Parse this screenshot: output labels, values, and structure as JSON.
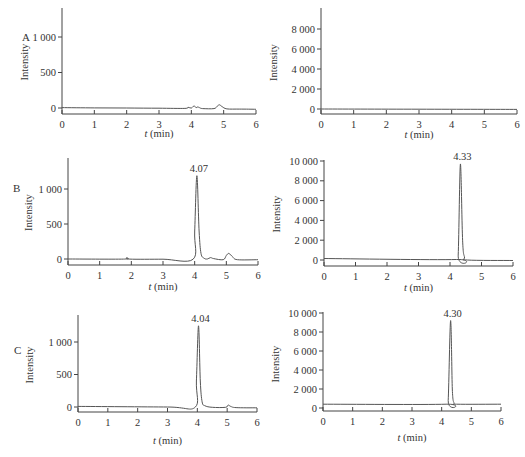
{
  "figure": {
    "panel_labels": [
      "A",
      "B",
      "C"
    ]
  },
  "chart_data": [
    {
      "id": "A-left",
      "row": "A",
      "type": "line",
      "title": "",
      "xlabel": "t (min)",
      "ylabel": "Intensity",
      "xlim": [
        0,
        6
      ],
      "ylim": [
        -60,
        1400
      ],
      "xticks": [
        "0",
        "1",
        "2",
        "3",
        "4",
        "5",
        "6"
      ],
      "yticks": [
        {
          "v": 0,
          "label": "0"
        },
        {
          "v": 500,
          "label": "500"
        },
        {
          "v": 1000,
          "label": "1 000"
        }
      ],
      "peaks": [],
      "x": [
        0,
        1,
        2,
        3,
        3.8,
        3.9,
        4.0,
        4.05,
        4.1,
        4.15,
        4.2,
        4.25,
        4.35,
        4.7,
        4.8,
        4.87,
        4.95,
        5.1,
        5.5,
        6
      ],
      "y": [
        5,
        2,
        0,
        -3,
        -5,
        10,
        -2,
        20,
        25,
        5,
        15,
        5,
        -8,
        -8,
        25,
        45,
        20,
        -12,
        -15,
        -18
      ],
      "grid": false,
      "legend": null
    },
    {
      "id": "A-right",
      "row": "A",
      "type": "line",
      "title": "",
      "xlabel": "t (min)",
      "ylabel": "Intensity",
      "xlim": [
        0,
        6
      ],
      "ylim": [
        -500,
        10000
      ],
      "xticks": [
        "0",
        "1",
        "2",
        "3",
        "4",
        "5",
        "6"
      ],
      "yticks": [
        {
          "v": 0,
          "label": "0"
        },
        {
          "v": 2000,
          "label": "2 000"
        },
        {
          "v": 4000,
          "label": "4 000"
        },
        {
          "v": 6000,
          "label": "6 000"
        },
        {
          "v": 8000,
          "label": "8 000"
        }
      ],
      "peaks": [],
      "x": [
        0,
        6
      ],
      "y": [
        0,
        -40
      ],
      "grid": false,
      "legend": null
    },
    {
      "id": "B-left",
      "row": "B",
      "type": "line",
      "title": "",
      "xlabel": "t (min)",
      "ylabel": "Intensity",
      "xlim": [
        0,
        6
      ],
      "ylim": [
        -60,
        1450
      ],
      "xticks": [
        "0",
        "1",
        "2",
        "3",
        "4",
        "5",
        "6"
      ],
      "yticks": [
        {
          "v": 0,
          "label": "0"
        },
        {
          "v": 500,
          "label": "500"
        },
        {
          "v": 1000,
          "label": "1 000"
        }
      ],
      "peaks": [
        {
          "x": 4.07,
          "y": 1190,
          "label": "4.07"
        }
      ],
      "x": [
        0,
        1.75,
        1.85,
        1.95,
        3.0,
        3.95,
        4.0,
        4.07,
        4.14,
        4.2,
        4.3,
        4.4,
        4.5,
        4.6,
        4.9,
        5.0,
        5.08,
        5.2,
        5.35,
        6
      ],
      "y": [
        0,
        -2,
        18,
        -2,
        -3,
        -3,
        400,
        1190,
        400,
        80,
        10,
        0,
        20,
        5,
        -10,
        50,
        80,
        30,
        -10,
        -10
      ],
      "grid": false,
      "legend": null
    },
    {
      "id": "B-right",
      "row": "B",
      "type": "line",
      "title": "",
      "xlabel": "t (min)",
      "ylabel": "Intensity",
      "xlim": [
        0,
        6
      ],
      "ylim": [
        -500,
        10300
      ],
      "xticks": [
        "0",
        "1",
        "2",
        "3",
        "4",
        "5",
        "6"
      ],
      "yticks": [
        {
          "v": 0,
          "label": "0"
        },
        {
          "v": 2000,
          "label": "2 000"
        },
        {
          "v": 4000,
          "label": "4 000"
        },
        {
          "v": 6000,
          "label": "6 000"
        },
        {
          "v": 8000,
          "label": "8 000"
        },
        {
          "v": 10000,
          "label": "10 000"
        }
      ],
      "peaks": [
        {
          "x": 4.33,
          "y": 9700,
          "label": "4.33"
        }
      ],
      "x": [
        0,
        4.2,
        4.26,
        4.33,
        4.4,
        4.46,
        4.55,
        6
      ],
      "y": [
        150,
        50,
        500,
        9700,
        2000,
        300,
        0,
        -50
      ],
      "grid": false,
      "legend": null
    },
    {
      "id": "C-left",
      "row": "C",
      "type": "line",
      "title": "",
      "xlabel": "t (min)",
      "ylabel": "Intensity",
      "xlim": [
        0,
        6
      ],
      "ylim": [
        -60,
        1400
      ],
      "xticks": [
        "0",
        "1",
        "2",
        "3",
        "4",
        "5",
        "6"
      ],
      "yticks": [
        {
          "v": 0,
          "label": "0"
        },
        {
          "v": 500,
          "label": "500"
        },
        {
          "v": 1000,
          "label": "1 000"
        }
      ],
      "peaks": [
        {
          "x": 4.04,
          "y": 1250,
          "label": "4.04"
        }
      ],
      "x": [
        0,
        3.0,
        3.93,
        3.97,
        4.04,
        4.1,
        4.16,
        4.25,
        4.5,
        4.95,
        5.03,
        5.12,
        5.3,
        6
      ],
      "y": [
        10,
        0,
        -3,
        400,
        1250,
        400,
        80,
        20,
        -5,
        -5,
        30,
        10,
        -10,
        -12
      ],
      "grid": false,
      "legend": null
    },
    {
      "id": "C-right",
      "row": "C",
      "type": "line",
      "title": "",
      "xlabel": "t (min)",
      "ylabel": "Intensity",
      "xlim": [
        0,
        6
      ],
      "ylim": [
        -300,
        10300
      ],
      "xticks": [
        "0",
        "1",
        "2",
        "3",
        "4",
        "5",
        "6"
      ],
      "yticks": [
        {
          "v": 0,
          "label": "0"
        },
        {
          "v": 2000,
          "label": "2 000"
        },
        {
          "v": 4000,
          "label": "4 000"
        },
        {
          "v": 6000,
          "label": "6 000"
        },
        {
          "v": 8000,
          "label": "8 000"
        },
        {
          "v": 10000,
          "label": "10 000"
        }
      ],
      "peaks": [
        {
          "x": 4.3,
          "y": 9200,
          "label": "4.30"
        }
      ],
      "x": [
        0,
        4.15,
        4.22,
        4.3,
        4.36,
        4.42,
        4.5,
        6
      ],
      "y": [
        400,
        400,
        800,
        9200,
        2000,
        500,
        400,
        400
      ],
      "grid": false,
      "legend": null
    }
  ]
}
